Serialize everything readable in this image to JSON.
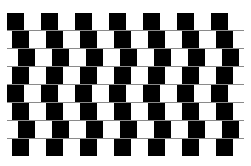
{
  "illusion": {
    "name": "cafe-wall",
    "colors": {
      "dark": "#000000",
      "light": "#ffffff",
      "mortar": "#8a8a8a",
      "background": "#ffffff"
    },
    "grid": {
      "left": 7,
      "right": 240,
      "top": 13,
      "row_height": 17,
      "row_pitch": 18,
      "tile_width": 17,
      "tile_pitch": 34
    },
    "rows": [
      {
        "offset": 7
      },
      {
        "offset": 12
      },
      {
        "offset": 18
      },
      {
        "offset": 12
      },
      {
        "offset": 7
      },
      {
        "offset": 12
      },
      {
        "offset": 18
      },
      {
        "offset": 12
      }
    ]
  }
}
